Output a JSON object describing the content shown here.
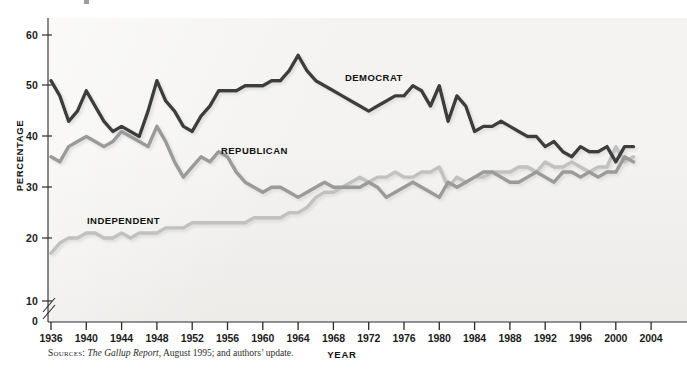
{
  "chart_data": {
    "type": "line",
    "title": "",
    "xlabel": "YEAR",
    "ylabel": "PERCENTAGE",
    "xlim": [
      1936,
      2004
    ],
    "ylim": [
      0,
      60
    ],
    "yticks": [
      0,
      10,
      20,
      30,
      40,
      50,
      60
    ],
    "xticks": [
      1936,
      1940,
      1944,
      1948,
      1952,
      1956,
      1960,
      1964,
      1968,
      1972,
      1976,
      1980,
      1984,
      1988,
      1992,
      1996,
      2000,
      2004
    ],
    "y_axis_break_between": [
      10,
      20
    ],
    "grid": false,
    "legend_position": "inline-labels",
    "x": [
      1936,
      1937,
      1938,
      1939,
      1940,
      1941,
      1942,
      1943,
      1944,
      1945,
      1946,
      1947,
      1948,
      1949,
      1950,
      1951,
      1952,
      1953,
      1954,
      1955,
      1956,
      1957,
      1958,
      1959,
      1960,
      1961,
      1962,
      1963,
      1964,
      1965,
      1966,
      1967,
      1968,
      1969,
      1970,
      1971,
      1972,
      1973,
      1974,
      1975,
      1976,
      1977,
      1978,
      1979,
      1980,
      1981,
      1982,
      1983,
      1984,
      1985,
      1986,
      1987,
      1988,
      1989,
      1990,
      1991,
      1992,
      1993,
      1994,
      1995,
      1996,
      1997,
      1998,
      1999,
      2000,
      2001,
      2002
    ],
    "series": [
      {
        "name": "DEMOCRAT",
        "color": "#3c3c3c",
        "values": [
          51,
          48,
          43,
          45,
          49,
          46,
          43,
          41,
          42,
          41,
          40,
          45,
          51,
          47,
          45,
          42,
          41,
          44,
          46,
          49,
          49,
          49,
          50,
          50,
          50,
          51,
          51,
          53,
          56,
          53,
          51,
          50,
          49,
          48,
          47,
          46,
          45,
          46,
          47,
          48,
          48,
          50,
          49,
          46,
          50,
          43,
          48,
          46,
          41,
          42,
          42,
          43,
          42,
          41,
          40,
          40,
          38,
          39,
          37,
          36,
          38,
          37,
          37,
          38,
          35,
          38,
          38
        ]
      },
      {
        "name": "REPUBLICAN",
        "color": "#9a9a9a",
        "values": [
          36,
          35,
          38,
          39,
          40,
          39,
          38,
          39,
          41,
          40,
          39,
          38,
          42,
          39,
          35,
          32,
          34,
          36,
          35,
          37,
          36,
          33,
          31,
          30,
          29,
          30,
          30,
          29,
          28,
          29,
          30,
          31,
          30,
          30,
          30,
          30,
          31,
          30,
          28,
          29,
          30,
          31,
          30,
          29,
          28,
          31,
          30,
          31,
          32,
          33,
          33,
          32,
          31,
          31,
          32,
          33,
          32,
          31,
          33,
          33,
          32,
          33,
          32,
          33,
          33,
          36,
          35
        ]
      },
      {
        "name": "INDEPENDENT",
        "color": "#c1c1c1",
        "values": [
          17,
          19,
          20,
          20,
          21,
          21,
          20,
          20,
          21,
          20,
          21,
          21,
          21,
          22,
          22,
          22,
          23,
          23,
          23,
          23,
          23,
          23,
          23,
          24,
          24,
          24,
          24,
          25,
          25,
          26,
          28,
          29,
          29,
          30,
          31,
          32,
          31,
          32,
          32,
          33,
          32,
          32,
          33,
          33,
          34,
          30,
          32,
          31,
          32,
          32,
          33,
          33,
          33,
          34,
          34,
          33,
          35,
          34,
          34,
          35,
          34,
          33,
          34,
          34,
          38,
          35,
          36
        ]
      }
    ]
  },
  "axes": {
    "y_title": "PERCENTAGE",
    "x_title": "YEAR",
    "y_tick_labels": [
      "60",
      "50",
      "40",
      "30",
      "20",
      "10",
      "0"
    ],
    "x_tick_labels": [
      "1936",
      "1940",
      "1944",
      "1948",
      "1952",
      "1956",
      "1960",
      "1964",
      "1968",
      "1972",
      "1976",
      "1980",
      "1984",
      "1988",
      "1992",
      "1996",
      "2000",
      "2004"
    ]
  },
  "series_labels": {
    "democrat": "DEMOCRAT",
    "republican": "REPUBLICAN",
    "independent": "INDEPENDENT"
  },
  "source": {
    "kicker": "Sources:",
    "italic_title": "The Gallup Report,",
    "rest": " August 1995; and authors’ update."
  }
}
